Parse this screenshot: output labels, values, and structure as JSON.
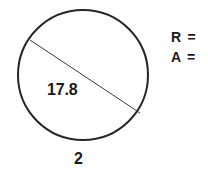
{
  "figure": {
    "shape": "circle",
    "circle": {
      "center_x": 83,
      "center_y": 75,
      "radius": 65,
      "stroke_color": "#262626",
      "stroke_width": 2
    },
    "chord": {
      "x1": 30,
      "y1": 40,
      "x2": 140,
      "y2": 113,
      "stroke_color": "#3a3a3a",
      "stroke_width": 1
    },
    "chord_length_label": "17.8",
    "bottom_label": "2"
  },
  "answers": {
    "radius_label": "R =",
    "area_label": "A ="
  },
  "colors": {
    "ink": "#1b1b1b",
    "background": "#ffffff"
  }
}
